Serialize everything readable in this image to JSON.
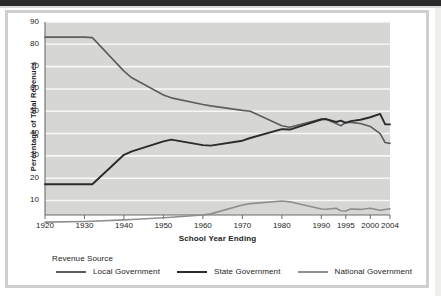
{
  "chart_data": {
    "type": "line",
    "title": "",
    "xlabel": "School Year Ending",
    "ylabel": "Percentage of Total Revenues",
    "ylim": [
      3.5,
      90
    ],
    "yticks": [
      10,
      20,
      30,
      40,
      50,
      60,
      70,
      80,
      90
    ],
    "xticks": [
      1920,
      1930,
      1940,
      1950,
      1960,
      1970,
      1980,
      1990,
      1995,
      2000,
      2004
    ],
    "grid": "horizontal-white-on-gray",
    "legend_title": "Revenue Source",
    "legend_position": "below-axis",
    "x": [
      1920,
      1930,
      1932,
      1940,
      1942,
      1950,
      1952,
      1960,
      1962,
      1970,
      1972,
      1980,
      1982,
      1990,
      1991,
      1993,
      1994,
      1995,
      1996,
      1998,
      2000,
      2002,
      2003,
      2004
    ],
    "series": [
      {
        "name": "Local Government",
        "color": "#5d5d5d",
        "values": [
          83.2,
          83.2,
          83.0,
          68.0,
          65.0,
          57.3,
          56.0,
          53.0,
          52.4,
          50.4,
          50.0,
          43.5,
          42.8,
          46.5,
          46.4,
          44.5,
          43.5,
          45.0,
          45.0,
          44.5,
          43.2,
          40.0,
          36.0,
          35.6
        ]
      },
      {
        "name": "State Government",
        "color": "#2b2b2b",
        "values": [
          17.3,
          17.3,
          17.3,
          30.5,
          32.0,
          36.5,
          37.3,
          34.8,
          34.6,
          36.8,
          38.0,
          42.0,
          41.8,
          46.3,
          46.5,
          45.2,
          45.8,
          44.8,
          45.6,
          46.2,
          47.3,
          48.8,
          44.2,
          44.1
        ]
      },
      {
        "name": "National Government",
        "color": "#8e8e8e",
        "values": [
          0.3,
          0.6,
          0.7,
          1.3,
          1.5,
          2.3,
          2.5,
          3.5,
          4.0,
          8.0,
          8.6,
          9.8,
          9.4,
          6.2,
          6.1,
          6.5,
          5.4,
          5.3,
          6.2,
          6.0,
          6.5,
          5.6,
          6.0,
          6.3
        ]
      }
    ]
  },
  "axis": {
    "y_title": "Percentage of Total Revenues",
    "x_title": "School Year Ending",
    "y_tick_labels": [
      "90",
      "80",
      "70",
      "60",
      "50",
      "40",
      "30",
      "20",
      "10"
    ],
    "x_tick_labels": [
      "1920",
      "1930",
      "1940",
      "1950",
      "1960",
      "1970",
      "1980",
      "1990",
      "1995",
      "2000",
      "2004"
    ]
  },
  "legend": {
    "title": "Revenue Source",
    "items": [
      {
        "label": "Local Government",
        "color": "#5d5d5d"
      },
      {
        "label": "State Government",
        "color": "#2b2b2b"
      },
      {
        "label": "National Government",
        "color": "#8e8e8e"
      }
    ]
  },
  "colors": {
    "plot_background": "#d6d6d4",
    "gridline": "#f7f7f5",
    "axis_line": "#6b6b6b",
    "frame": "#cfcfcd",
    "text": "#1c1c1c"
  }
}
